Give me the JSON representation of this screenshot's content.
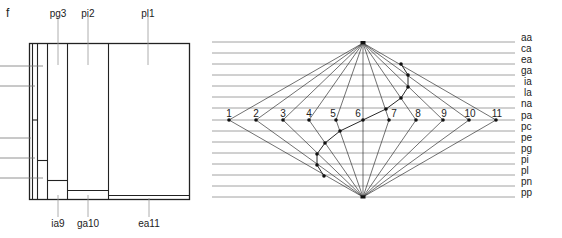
{
  "figure_label": "f",
  "left_diagram": {
    "top_labels": [
      {
        "text": "pg3",
        "x": 58,
        "leader_x": 58
      },
      {
        "text": "pi2",
        "x": 88,
        "leader_x": 88
      },
      {
        "text": "pl1",
        "x": 148,
        "leader_x": 148
      }
    ],
    "bottom_labels": [
      {
        "text": "ia9",
        "x": 58,
        "leader_x": 58
      },
      {
        "text": "ga10",
        "x": 88,
        "leader_x": 88
      },
      {
        "text": "ea11",
        "x": 149,
        "leader_x": 149
      }
    ]
  },
  "right_diagram": {
    "row_labels": [
      "aa",
      "ca",
      "ea",
      "ga",
      "ia",
      "la",
      "na",
      "pa",
      "pc",
      "pe",
      "pg",
      "pi",
      "pl",
      "pn",
      "pp"
    ],
    "point_labels": [
      "1",
      "2",
      "3",
      "4",
      "5",
      "6",
      "7",
      "8",
      "9",
      "10",
      "11"
    ]
  },
  "colors": {
    "line": "#222222",
    "grid": "#8a8a8a",
    "text": "#222222"
  }
}
